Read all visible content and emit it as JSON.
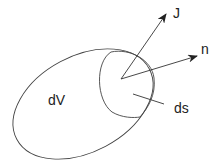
{
  "diagram": {
    "labels": {
      "J": "J",
      "n": "n",
      "dV": "dV",
      "ds": "ds"
    },
    "colors": {
      "stroke": "#333333",
      "text": "#222222",
      "background": "#ffffff"
    }
  }
}
